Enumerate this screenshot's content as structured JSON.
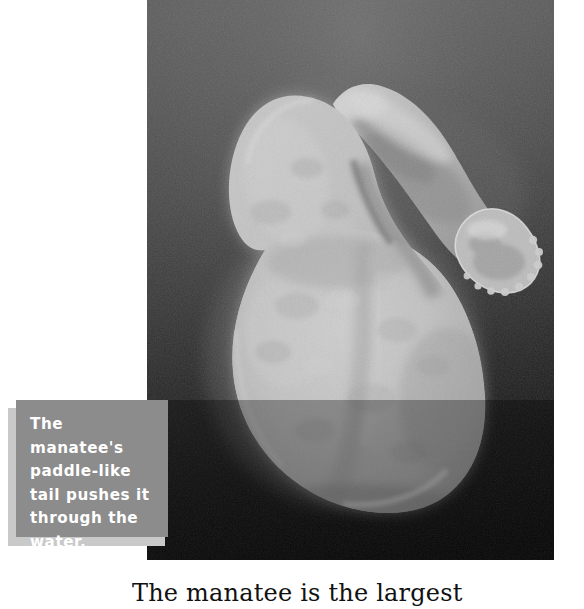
{
  "page": {
    "background_color": "#ffffff",
    "width": 584,
    "height": 598
  },
  "photo": {
    "name": "manatee-underwater-photograph",
    "alt_description": "Underwater photograph of a manatee seen from below, showing its large rounded paddle-like tail and one flipper, against dark murky water",
    "frame": {
      "x": 147,
      "y": 0,
      "width": 407,
      "height": 560
    },
    "water_background_top_color": "#565656",
    "water_background_bottom_color": "#050505",
    "animal_body_color": "#b9b9b9",
    "animal_highlight_color": "#d9d9d9",
    "animal_shadow_color": "#7e7e7e"
  },
  "caption": {
    "text": "The manatee's\npaddle-like\ntail pushes it\nthrough the\nwater.",
    "lines": [
      "The manatee's",
      "paddle-like",
      "tail pushes it",
      "through the",
      "water."
    ],
    "box_color": "#8c8c8c",
    "shadow_color": "#c9c9c9",
    "text_color": "#ffffff"
  },
  "body_text": {
    "line": "The manatee is the largest",
    "color": "#111111"
  }
}
